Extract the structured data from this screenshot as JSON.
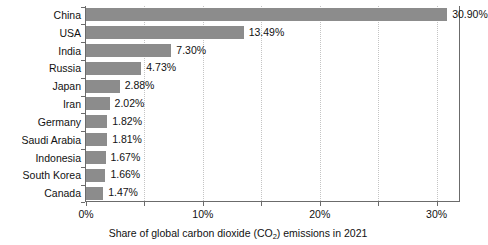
{
  "chart_data": {
    "type": "bar",
    "orientation": "horizontal",
    "title": "",
    "xlabel": "Share of global carbon dioxide (CO2) emissions in 2021",
    "xlabel_prefix": "Share of global carbon dioxide (CO",
    "xlabel_sub": "2",
    "xlabel_suffix": ") emissions in 2021",
    "ylabel": "",
    "categories": [
      "China",
      "USA",
      "India",
      "Russia",
      "Japan",
      "Iran",
      "Germany",
      "Saudi Arabia",
      "Indonesia",
      "South Korea",
      "Canada"
    ],
    "values": [
      30.9,
      13.49,
      7.3,
      4.73,
      2.88,
      2.02,
      1.82,
      1.81,
      1.67,
      1.66,
      1.47
    ],
    "value_labels": [
      "30.90%",
      "13.49%",
      "7.30%",
      "4.73%",
      "2.88%",
      "2.02%",
      "1.82%",
      "1.81%",
      "1.67%",
      "1.66%",
      "1.47%"
    ],
    "xlim": [
      0,
      32
    ],
    "xticks": [
      0,
      5,
      10,
      15,
      20,
      25,
      30
    ],
    "xtick_labels": [
      "0%",
      "",
      "10%",
      "",
      "20%",
      "",
      "30%"
    ],
    "grid": true,
    "grid_axis": "x",
    "grid_style": "dotted",
    "legend": false,
    "bar_color": "#8c8c8c",
    "axis_color": "#6b6b6b",
    "grid_color": "#c4c4c4",
    "background": "#ffffff"
  }
}
